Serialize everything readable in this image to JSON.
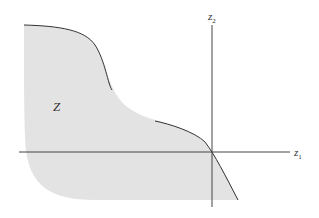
{
  "diagram": {
    "region_label": "Z",
    "axes": {
      "x_label": "z",
      "x_sub": "1",
      "y_label": "z",
      "y_sub": "2"
    },
    "colors": {
      "region_fill": "#e3e3e3",
      "boundary": "#333333",
      "axis": "#444444"
    }
  }
}
